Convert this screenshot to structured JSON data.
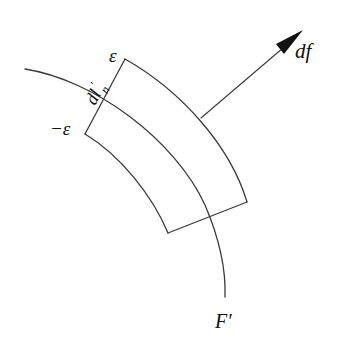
{
  "diagram": {
    "labels": {
      "epsilon_top": "ε",
      "epsilon_bottom": "−ε",
      "dl_n": "dl",
      "dl_n_sub": "n",
      "dl_n_prime": "′",
      "vector": "df",
      "curve": "F′"
    },
    "colors": {
      "line": "#3a3a3a",
      "text": "#111111",
      "background": "#ffffff"
    }
  }
}
